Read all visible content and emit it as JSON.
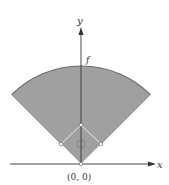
{
  "diagram": {
    "axes": {
      "x_label": "x",
      "y_label": "y"
    },
    "origin_label": "(0, 0)",
    "curve_label": "f",
    "colors": {
      "field_fill": "#a0a0a0",
      "field_edge": "#6a6a6a",
      "axis": "#333333",
      "base": "#ffffff"
    },
    "sector": {
      "center": [
        81,
        164
      ],
      "radius": 98,
      "half_angle_deg": 45
    },
    "bases": [
      {
        "name": "home",
        "pos": [
          81,
          164
        ]
      },
      {
        "name": "first",
        "pos": [
          101,
          144
        ]
      },
      {
        "name": "second",
        "pos": [
          81,
          125
        ]
      },
      {
        "name": "third",
        "pos": [
          61,
          144
        ]
      }
    ],
    "mound": {
      "pos": [
        81,
        144
      ],
      "r": 4
    }
  }
}
